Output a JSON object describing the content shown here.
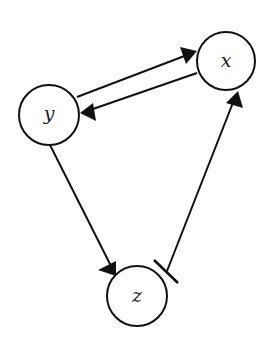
{
  "diagram": {
    "type": "directed-graph",
    "nodes": [
      {
        "id": "x",
        "label": "x",
        "cx": 226,
        "cy": 61,
        "r": 29
      },
      {
        "id": "y",
        "label": "y",
        "cx": 49,
        "cy": 115,
        "r": 30
      },
      {
        "id": "z",
        "label": "z",
        "cx": 137,
        "cy": 296,
        "r": 30
      }
    ],
    "edges": [
      {
        "from": "y",
        "to": "x",
        "kind": "activation"
      },
      {
        "from": "x",
        "to": "y",
        "kind": "activation"
      },
      {
        "from": "y",
        "to": "z",
        "kind": "activation"
      },
      {
        "from": "z",
        "to": "x",
        "kind": "activation",
        "source_marker": "inhibition-bar"
      }
    ]
  }
}
